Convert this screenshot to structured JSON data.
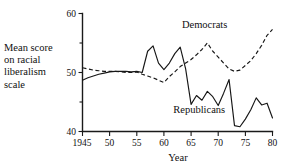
{
  "chart_data": {
    "type": "line",
    "title": "",
    "xlabel": "Year",
    "ylabel": "Mean score on racial liberalism scale",
    "ylabel_lines": [
      "Mean score",
      "on racial",
      "liberalism",
      "scale"
    ],
    "xlim": [
      1945,
      1980
    ],
    "ylim": [
      40,
      60
    ],
    "grid": false,
    "legend_position": "inline-annotations",
    "x_ticks": [
      1945,
      1950,
      1955,
      1960,
      1965,
      1970,
      1975,
      1980
    ],
    "x_tick_labels": [
      "1945",
      "50",
      "55",
      "60",
      "65",
      "70",
      "75",
      "80"
    ],
    "y_ticks": [
      40,
      45,
      50,
      55,
      60
    ],
    "y_tick_labels": [
      "40",
      "",
      "50",
      "",
      "60"
    ],
    "y_major_labels": [
      "40",
      "50",
      "60"
    ],
    "annotations": [
      {
        "text": "Democrats",
        "x": 1967.5,
        "y": 57.6
      },
      {
        "text": "Republicans",
        "x": 1966.5,
        "y": 43.2
      }
    ],
    "x": [
      1945,
      1946,
      1947,
      1948,
      1949,
      1950,
      1951,
      1952,
      1953,
      1954,
      1955,
      1956,
      1957,
      1958,
      1959,
      1960,
      1961,
      1962,
      1963,
      1964,
      1965,
      1966,
      1967,
      1968,
      1969,
      1970,
      1971,
      1972,
      1973,
      1974,
      1975,
      1976,
      1977,
      1978,
      1979,
      1980
    ],
    "series": [
      {
        "name": "Democrats",
        "style": "dashed",
        "values": [
          50.8,
          50.6,
          50.4,
          50.3,
          50.2,
          50.2,
          50.2,
          50.1,
          50.0,
          50.0,
          50.1,
          49.7,
          49.4,
          49.1,
          48.7,
          48.3,
          49.3,
          50.1,
          51.0,
          51.6,
          52.2,
          53.0,
          53.9,
          55.0,
          53.6,
          52.6,
          51.6,
          50.6,
          50.2,
          50.4,
          51.2,
          52.0,
          53.2,
          54.6,
          56.3,
          57.3
        ]
      },
      {
        "name": "Republicans",
        "style": "solid",
        "values": [
          48.7,
          49.1,
          49.4,
          49.7,
          49.9,
          50.1,
          50.2,
          50.2,
          50.2,
          50.1,
          50.2,
          50.0,
          53.6,
          54.5,
          51.6,
          50.5,
          51.6,
          53.2,
          54.3,
          50.6,
          44.6,
          46.1,
          45.3,
          46.8,
          45.9,
          44.4,
          46.5,
          48.8,
          41.0,
          40.8,
          42.1,
          43.7,
          45.7,
          44.5,
          44.8,
          42.3
        ]
      }
    ]
  }
}
